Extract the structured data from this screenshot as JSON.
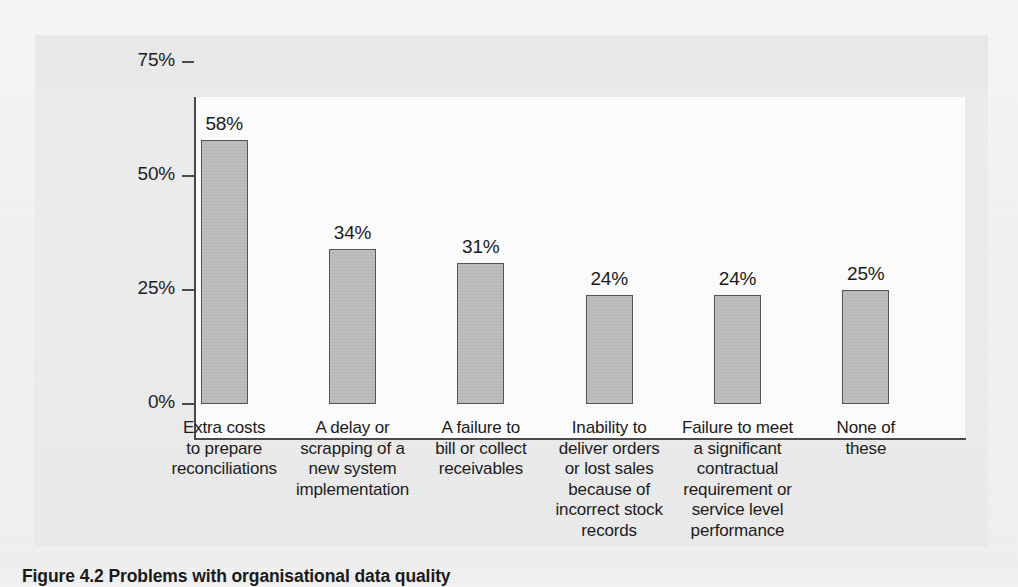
{
  "figure": {
    "caption": "Figure 4.2 Problems with organisational data quality"
  },
  "chart_data": {
    "type": "bar",
    "title": "",
    "xlabel": "",
    "ylabel": "",
    "ylim": [
      0,
      75
    ],
    "grid": false,
    "legend": null,
    "categories": [
      "Extra costs\nto prepare\nreconciliations",
      "A delay or\nscrapping of a\nnew system\nimplementation",
      "A failure to\nbill or collect\nreceivables",
      "Inability to\ndeliver orders\nor lost sales\nbecause of\nincorrect stock\nrecords",
      "Failure to meet\na significant\ncontractual\nrequirement or\nservice level\nperformance",
      "None of\nthese"
    ],
    "values": [
      58,
      34,
      31,
      24,
      24,
      25
    ],
    "value_labels": [
      "58%",
      "34%",
      "31%",
      "24%",
      "24%",
      "25%"
    ],
    "yticks": [
      0,
      25,
      50,
      75
    ],
    "ytick_labels": [
      "0%",
      "25%",
      "50%",
      "75%"
    ],
    "bar_color": "#bdbdbd",
    "bar_edge_color": "#555555",
    "axis_color": "#4a4a4a",
    "plot_background": "#fbfbfb",
    "panel_background": "#eaeaea"
  }
}
